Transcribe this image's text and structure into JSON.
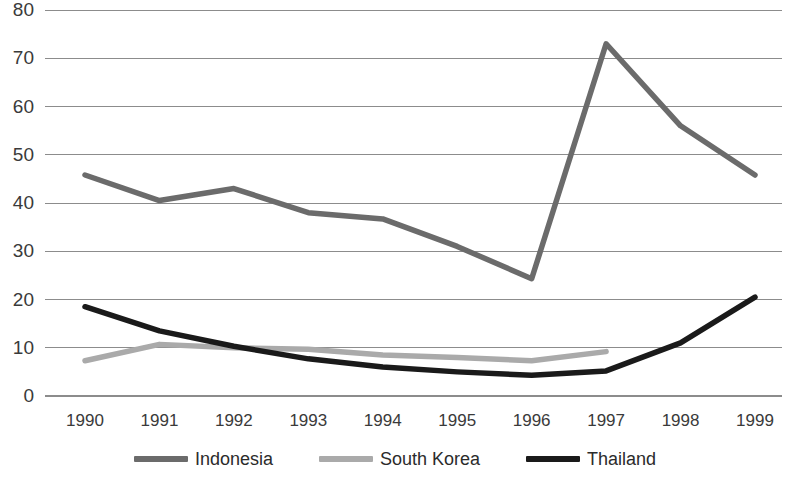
{
  "chart_data": {
    "type": "line",
    "title": "",
    "subtitle": "",
    "xlabel": "",
    "ylabel": "",
    "categories": [
      "1990",
      "1991",
      "1992",
      "1993",
      "1994",
      "1995",
      "1996",
      "1997",
      "1998",
      "1999"
    ],
    "xlim": [
      1990,
      1999
    ],
    "ylim": [
      0,
      80
    ],
    "yticks": [
      0,
      10,
      20,
      30,
      40,
      50,
      60,
      70,
      80
    ],
    "ytick_labels": [
      "0",
      "10",
      "20",
      "30",
      "40",
      "50",
      "60",
      "70",
      "80"
    ],
    "xtick_labels": [
      "1990",
      "1991",
      "1992",
      "1993",
      "1994",
      "1995",
      "1996",
      "1997",
      "1998",
      "1999"
    ],
    "grid": {
      "horizontal": true,
      "vertical": false,
      "color": "#8c8c8c"
    },
    "legend": {
      "position": "bottom",
      "orientation": "horizontal"
    },
    "series": [
      {
        "name": "Indonesia",
        "color": "#6b6b6b",
        "x": [
          "1990",
          "1991",
          "1992",
          "1993",
          "1994",
          "1995",
          "1996",
          "1997",
          "1998",
          "1999"
        ],
        "values": [
          45.8,
          40.5,
          43.0,
          38.0,
          36.7,
          31.0,
          24.3,
          73.0,
          56.0,
          45.8
        ]
      },
      {
        "name": "South Korea",
        "color": "#aaaaaa",
        "x": [
          "1990",
          "1991",
          "1992",
          "1993",
          "1994",
          "1995",
          "1996",
          "1997"
        ],
        "values": [
          7.3,
          10.7,
          10.0,
          9.7,
          8.5,
          8.0,
          7.3,
          9.2
        ]
      },
      {
        "name": "Thailand",
        "color": "#1a1a1a",
        "x": [
          "1990",
          "1991",
          "1992",
          "1993",
          "1994",
          "1995",
          "1996",
          "1997",
          "1998",
          "1999"
        ],
        "values": [
          18.5,
          13.5,
          10.3,
          7.7,
          6.0,
          5.0,
          4.3,
          5.2,
          11.0,
          20.5
        ]
      }
    ]
  },
  "legend": {
    "items": [
      {
        "label": "Indonesia"
      },
      {
        "label": "South Korea"
      },
      {
        "label": "Thailand"
      }
    ]
  },
  "colors": {
    "indonesia": "#6b6b6b",
    "south_korea": "#aaaaaa",
    "thailand": "#1a1a1a",
    "gridline": "#8c8c8c",
    "axis_text": "#3a3a3a",
    "background": "#ffffff"
  }
}
